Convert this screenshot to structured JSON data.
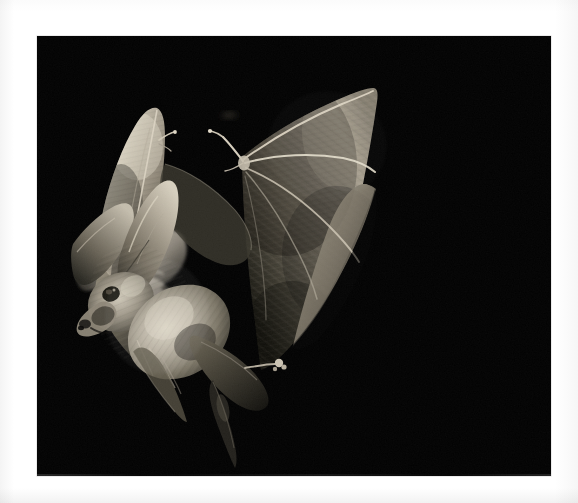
{
  "page": {
    "type": "photograph",
    "background_color": "#ffffff",
    "photo_background_color": "#030303",
    "caption": "",
    "photo_frame": {
      "x": 37,
      "y": 36,
      "width": 514,
      "height": 440
    }
  },
  "scene": {
    "description": "Night flash photograph of a long-eared bat in flight approaching a moth against a pure black background",
    "subjects": [
      {
        "name": "bat",
        "common_name": "Long-eared bat",
        "label": "bat-in-flight",
        "tone": "#b9b2a6",
        "position": {
          "x": 262,
          "y": 48,
          "width": 288,
          "height": 390
        },
        "parts": [
          "right-wing-extended",
          "left-wing-raised",
          "large-ears",
          "furred-body",
          "tail-membrane",
          "thumb-claw",
          "foot-claw"
        ]
      },
      {
        "name": "moth",
        "label": "moth-prey",
        "tone": "#cfc9bd",
        "position": {
          "x": 76,
          "y": 238,
          "width": 88,
          "height": 78
        },
        "parts": [
          "forewing",
          "hindwing",
          "body-blur"
        ]
      },
      {
        "name": "speck",
        "label": "faint-speck",
        "tone": "#2a2722",
        "position": {
          "x": 228,
          "y": 114,
          "width": 12,
          "height": 5
        }
      }
    ],
    "palette": {
      "black": "#030303",
      "fur_highlight": "#d9d2c4",
      "fur_mid": "#8e8779",
      "fur_shadow": "#3a372f",
      "membrane_light": "#9e968a",
      "membrane_dark": "#2b2924",
      "bone_line": "#e4ddcd",
      "moth_highlight": "#ded8cc",
      "moth_mid": "#9b958a",
      "page_white": "#ffffff"
    }
  }
}
